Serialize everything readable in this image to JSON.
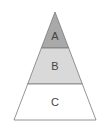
{
  "diagram": {
    "type": "pyramid",
    "layers": [
      {
        "label": "A",
        "fill": "#a9a9a9"
      },
      {
        "label": "B",
        "fill": "#d9d9d9"
      },
      {
        "label": "C",
        "fill": "#ffffff"
      }
    ],
    "stroke": "#7a7a7a"
  }
}
